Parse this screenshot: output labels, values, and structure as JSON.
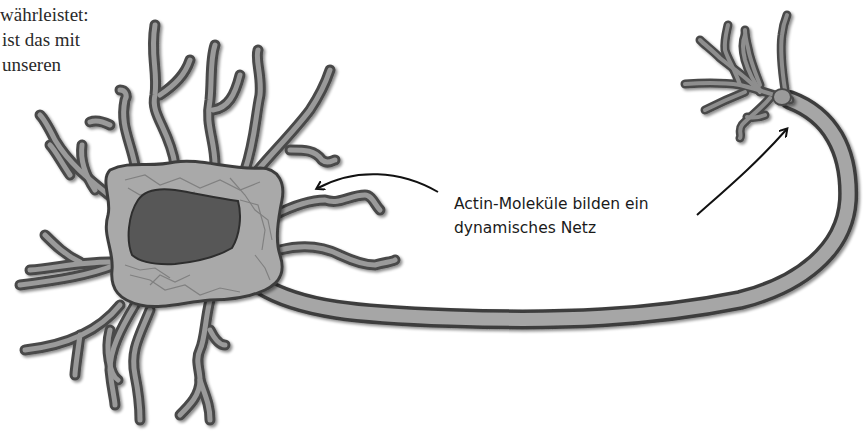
{
  "body_text": {
    "lines": [
      "währleistet:",
      "ist das mit",
      "unseren"
    ]
  },
  "figure": {
    "caption": {
      "line1": "Actin-Moleküle bilden ein",
      "line2": "dynamisches Netz"
    },
    "arrows": [
      {
        "name": "arrow-to-soma",
        "from": "caption",
        "to": "cell-body-dendrites"
      },
      {
        "name": "arrow-to-axon-terminal",
        "from": "caption",
        "to": "axon-terminal"
      }
    ],
    "colors": {
      "membrane": "#6e6e6e",
      "cytoplasm": "#a9a9a9",
      "nucleus": "#555555",
      "outline": "#3a3a3a",
      "actin": "#7a7a7a",
      "arrow": "#111111"
    }
  }
}
